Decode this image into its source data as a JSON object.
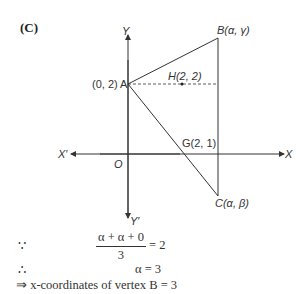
{
  "part_label": "(C)",
  "figure": {
    "axes": {
      "y": "Y",
      "y_neg": "Y′",
      "x": "X",
      "x_neg": "X′",
      "origin": "O"
    },
    "points": {
      "A": {
        "label": "(0, 2) A"
      },
      "B": {
        "label": "B(α, γ)"
      },
      "C": {
        "label": "C(α, β)"
      },
      "H": {
        "label": "H(2, 2)"
      },
      "G": {
        "label": "G(2, 1)"
      }
    }
  },
  "solution": {
    "because_symbol": "∵",
    "numerator": "α + α + 0",
    "denominator": "3",
    "equals": "= 2",
    "therefore_symbol": "∴",
    "result": "α = 3",
    "conclusion": "⇒ x-coordinates of vertex B = 3"
  }
}
